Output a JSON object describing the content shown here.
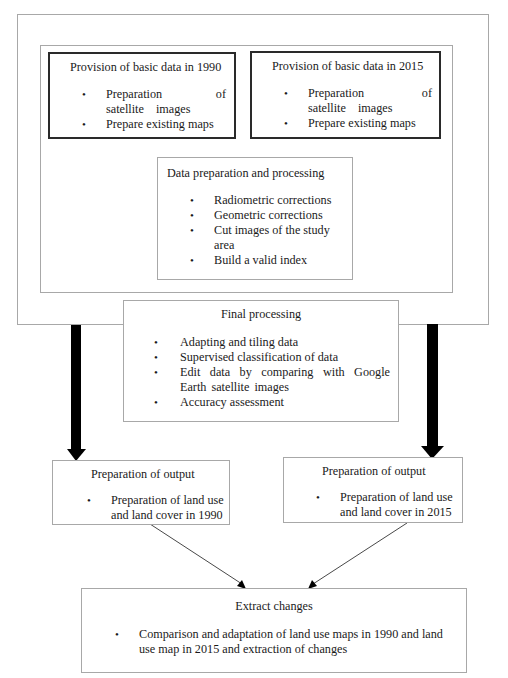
{
  "diagram": {
    "basic_1990": {
      "title": "Provision of basic data in 1990",
      "items": [
        "Preparation of satellite images",
        "Prepare existing maps"
      ]
    },
    "basic_2015": {
      "title": "Provision of basic data in 2015",
      "items": [
        "Preparation of satellite images",
        "Prepare existing maps"
      ]
    },
    "data_prep": {
      "title": "Data preparation and processing",
      "items": [
        "Radiometric corrections",
        "Geometric corrections",
        "Cut images of the study area",
        "Build a valid index"
      ]
    },
    "final_processing": {
      "title": "Final processing",
      "items": [
        "Adapting and tiling data",
        "Supervised classification of data",
        "Edit data by comparing with Google Earth satellite images",
        "Accuracy assessment"
      ]
    },
    "output_1990": {
      "title": "Preparation of output",
      "items": [
        "Preparation of land use and land cover in 1990"
      ]
    },
    "output_2015": {
      "title": "Preparation of output",
      "items": [
        "Preparation of land use and land cover in 2015"
      ]
    },
    "extract": {
      "title": "Extract changes",
      "items": [
        "Comparison and adaptation of land use maps in 1990 and land use map in 2015 and extraction of changes"
      ]
    }
  },
  "bullet_glyph": "•"
}
